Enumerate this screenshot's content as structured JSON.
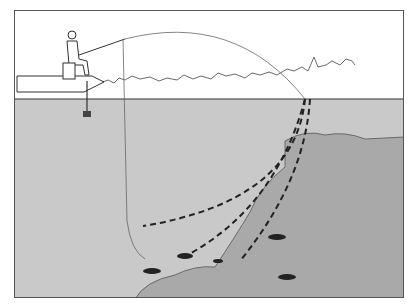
{
  "figure": {
    "kind": "fishing illustration",
    "scene": {
      "angler": "person in cap seated on boat casting",
      "boat": "bass boat with trolling motor",
      "shoreline": "tree line on horizon",
      "underwater": "rocky slope (riprap) descending on right",
      "fish_count": 5
    },
    "lines": {
      "cast_line": "solid thin arc from rod tip to water entry point",
      "vertical_line": "solid thin line dropping from surface near boat to bottom",
      "retrieve_paths": [
        "dashed path curving along mid-depth",
        "dashed path following rocks to bottom",
        "dashed path along rock slope"
      ]
    },
    "colors": {
      "water": "#c8c8c8",
      "rocks": "#a8a8a8",
      "sky": "#ffffff",
      "ink": "#222222"
    }
  }
}
